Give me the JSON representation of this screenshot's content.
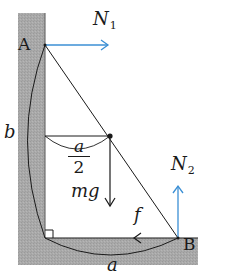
{
  "diagram": {
    "colors": {
      "surface_fill": "#a8a8a8",
      "line": "#1a1a1a",
      "force_blue": "#3b8fd4",
      "background": "#ffffff"
    },
    "points": {
      "A": "A",
      "B": "B"
    },
    "forces": {
      "N1": {
        "symbol": "N",
        "subscript": "1"
      },
      "N2": {
        "symbol": "N",
        "subscript": "2"
      },
      "weight": "mg",
      "friction": "f"
    },
    "dimensions": {
      "height_label": "b",
      "base_label": "a",
      "half_base_numerator": "a",
      "half_base_denominator": "2"
    }
  }
}
